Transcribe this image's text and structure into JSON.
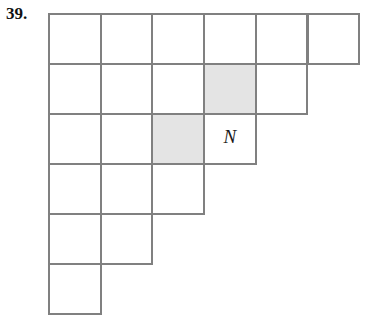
{
  "problem": {
    "number_label": "39."
  },
  "figure": {
    "type": "staircase-grid",
    "origin_x": 48,
    "origin_y": 13,
    "cell_width": 51.7,
    "cell_height": 50,
    "line_color": "#808080",
    "line_width_px": 2,
    "shade_color": "#e4e4e4",
    "background_color": "#ffffff",
    "rows": [
      {
        "row_index": 1,
        "cell_count": 6
      },
      {
        "row_index": 2,
        "cell_count": 5
      },
      {
        "row_index": 3,
        "cell_count": 4
      },
      {
        "row_index": 4,
        "cell_count": 3
      },
      {
        "row_index": 5,
        "cell_count": 2
      },
      {
        "row_index": 6,
        "cell_count": 1
      }
    ],
    "shaded_cells": [
      {
        "row": 2,
        "col": 4
      },
      {
        "row": 3,
        "col": 3
      }
    ],
    "labeled_cells": [
      {
        "row": 3,
        "col": 4,
        "label": "N"
      }
    ]
  }
}
